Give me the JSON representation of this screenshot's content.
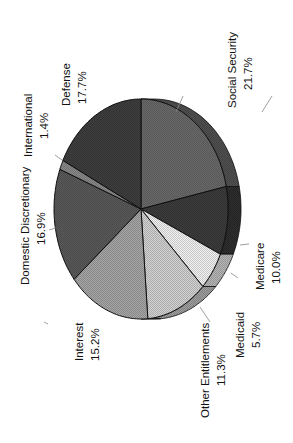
{
  "chart_data": {
    "type": "pie",
    "title": "",
    "orientation": "rotated 90° counter-clockwise (labels read bottom-to-top)",
    "style": "3D tilted pie, grayscale hatched fills",
    "categories": [
      "Social Security",
      "Medicare",
      "Medicaid",
      "Other Entitlements",
      "Interest",
      "Domestic Discretionary",
      "International",
      "Defense"
    ],
    "values": [
      21.7,
      10.0,
      5.7,
      11.3,
      15.2,
      16.9,
      1.4,
      17.7
    ],
    "unit": "%",
    "slices": [
      {
        "name": "Social Security",
        "value": 21.7,
        "label": "Social Security",
        "pct": "21.7%",
        "color": "#6a6a6a"
      },
      {
        "name": "Medicare",
        "value": 10.0,
        "label": "Medicare",
        "pct": "10.0%",
        "color": "#3c3c3c"
      },
      {
        "name": "Medicaid",
        "value": 5.7,
        "label": "Medicaid",
        "pct": "5.7%",
        "color": "#f2f2f2"
      },
      {
        "name": "Other Entitlements",
        "value": 11.3,
        "label": "Other Entitlements",
        "pct": "11.3%",
        "color": "#d2d2d2"
      },
      {
        "name": "Interest",
        "value": 15.2,
        "label": "Interest",
        "pct": "15.2%",
        "color": "#a6a6a6"
      },
      {
        "name": "Domestic Discretionary",
        "value": 16.9,
        "label": "Domestic Discretionary",
        "pct": "16.9%",
        "color": "#5a5a5a"
      },
      {
        "name": "International",
        "value": 1.4,
        "label": "International",
        "pct": "1.4%",
        "color": "#8a8a8a"
      },
      {
        "name": "Defense",
        "value": 17.7,
        "label": "Defense",
        "pct": "17.7%",
        "color": "#3e3e3e"
      }
    ],
    "legend": "none (direct labels with leader lines)"
  },
  "labels": {
    "social_security": {
      "name": "Social Security",
      "pct": "21.7%"
    },
    "medicare": {
      "name": "Medicare",
      "pct": "10.0%"
    },
    "medicaid": {
      "name": "Medicaid",
      "pct": "5.7%"
    },
    "other_entitlements": {
      "name": "Other Entitlements",
      "pct": "11.3%"
    },
    "interest": {
      "name": "Interest",
      "pct": "15.2%"
    },
    "domestic_discretionary": {
      "name": "Domestic Discretionary",
      "pct": "16.9%"
    },
    "international": {
      "name": "International",
      "pct": "1.4%"
    },
    "defense": {
      "name": "Defense",
      "pct": "17.7%"
    }
  }
}
